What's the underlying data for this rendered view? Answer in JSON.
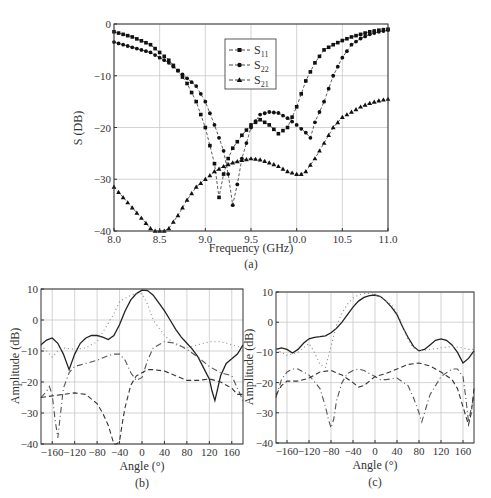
{
  "chart_data": [
    {
      "id": "a",
      "type": "line",
      "panel_label": "(a)",
      "title": "",
      "xlabel": "Frequency (GHz)",
      "ylabel": "S (DB)",
      "xlim": [
        8.0,
        11.0
      ],
      "ylim": [
        -40,
        0
      ],
      "xticks": [
        8.0,
        8.5,
        9.0,
        9.5,
        10.0,
        10.5,
        11.0
      ],
      "xtick_labels": [
        "8.0",
        "8.5",
        "9.0",
        "9.5",
        "10.0",
        "10.5",
        "11.0"
      ],
      "yticks": [
        0,
        -10,
        -20,
        -30,
        -40
      ],
      "ytick_labels": [
        "0",
        "−10",
        "−20",
        "−30",
        "−40"
      ],
      "grid": true,
      "legend_position": "upper center",
      "series": [
        {
          "name": "S11",
          "legend_main": "S",
          "legend_sub": "11",
          "marker": "square",
          "x": [
            8.0,
            8.2,
            8.4,
            8.5,
            8.6,
            8.7,
            8.8,
            8.9,
            9.0,
            9.1,
            9.15,
            9.2,
            9.25,
            9.3,
            9.4,
            9.5,
            9.6,
            9.7,
            9.8,
            9.9,
            10.0,
            10.1,
            10.2,
            10.3,
            10.4,
            10.5,
            10.6,
            10.7,
            10.8,
            10.9,
            11.0
          ],
          "y": [
            -1.5,
            -2.5,
            -4,
            -5.5,
            -7,
            -9,
            -11.5,
            -15,
            -20,
            -27,
            -33.5,
            -29,
            -26,
            -24,
            -21.5,
            -19.5,
            -18.5,
            -19.5,
            -21.2,
            -20,
            -16,
            -11,
            -7.5,
            -5,
            -4,
            -3.2,
            -2.5,
            -2,
            -1.5,
            -1.2,
            -1
          ]
        },
        {
          "name": "S22",
          "legend_main": "S",
          "legend_sub": "22",
          "marker": "circle",
          "x": [
            8.0,
            8.2,
            8.4,
            8.5,
            8.6,
            8.7,
            8.8,
            8.9,
            9.0,
            9.1,
            9.2,
            9.25,
            9.3,
            9.35,
            9.4,
            9.5,
            9.6,
            9.7,
            9.8,
            9.9,
            10.0,
            10.1,
            10.15,
            10.2,
            10.3,
            10.4,
            10.5,
            10.6,
            10.7,
            10.8,
            10.9,
            11.0
          ],
          "y": [
            -3.5,
            -4.5,
            -5.5,
            -6.5,
            -7.5,
            -9,
            -10.5,
            -12,
            -15,
            -19.5,
            -24.5,
            -29,
            -35,
            -31,
            -26,
            -20,
            -17.5,
            -17,
            -17.2,
            -18.2,
            -19.5,
            -21,
            -22,
            -19,
            -15,
            -10,
            -6.5,
            -4,
            -2.8,
            -2,
            -1.5,
            -1.2
          ]
        },
        {
          "name": "S21",
          "legend_main": "S",
          "legend_sub": "21",
          "marker": "triangle",
          "x": [
            8.0,
            8.1,
            8.2,
            8.3,
            8.4,
            8.45,
            8.5,
            8.55,
            8.6,
            8.7,
            8.8,
            8.9,
            9.0,
            9.1,
            9.2,
            9.3,
            9.4,
            9.5,
            9.6,
            9.7,
            9.8,
            9.9,
            10.0,
            10.05,
            10.1,
            10.2,
            10.3,
            10.4,
            10.5,
            10.6,
            10.7,
            10.8,
            10.9,
            11.0
          ],
          "y": [
            -31.5,
            -33.5,
            -35.5,
            -37.5,
            -39.5,
            -40,
            -40.2,
            -40,
            -39.5,
            -37,
            -34,
            -31.5,
            -30,
            -28.5,
            -27.5,
            -26.8,
            -26.3,
            -26,
            -26.2,
            -26.8,
            -27.5,
            -28.5,
            -29,
            -29,
            -28.5,
            -26,
            -23,
            -20,
            -18,
            -17,
            -16,
            -15.3,
            -14.8,
            -14.5
          ]
        }
      ]
    },
    {
      "id": "b",
      "type": "line",
      "panel_label": "(b)",
      "title": "",
      "xlabel": "Angle (°)",
      "ylabel": "Amplitude (dB)",
      "xlim": [
        -180,
        180
      ],
      "ylim": [
        -40,
        10
      ],
      "xticks": [
        -160,
        -120,
        -80,
        -40,
        0,
        40,
        80,
        120,
        160
      ],
      "xtick_labels": [
        "−160",
        "−120",
        "−80",
        "−40",
        "0",
        "40",
        "80",
        "120",
        "160"
      ],
      "yticks": [
        10,
        0,
        -10,
        -20,
        -30,
        -40
      ],
      "ytick_labels": [
        "10",
        "0",
        "−10",
        "−20",
        "−30",
        "−40"
      ],
      "grid": true,
      "series": [
        {
          "name": "solid",
          "style": "solid",
          "x": [
            -180,
            -170,
            -160,
            -150,
            -140,
            -130,
            -120,
            -110,
            -100,
            -90,
            -80,
            -70,
            -60,
            -50,
            -40,
            -30,
            -20,
            -10,
            0,
            10,
            20,
            30,
            40,
            50,
            60,
            70,
            80,
            90,
            100,
            110,
            120,
            125,
            130,
            135,
            140,
            150,
            160,
            170,
            180
          ],
          "y": [
            -8,
            -6.5,
            -5.8,
            -7.5,
            -11,
            -16,
            -11,
            -7.5,
            -5.8,
            -5,
            -5,
            -5.5,
            -6.3,
            -5,
            -1.5,
            3,
            6.5,
            8.5,
            9.6,
            9.5,
            8,
            5.5,
            3,
            0,
            -3,
            -5.5,
            -7.5,
            -9.5,
            -12,
            -15.5,
            -19,
            -23,
            -26,
            -22,
            -18,
            -14,
            -12.5,
            -11,
            -8
          ]
        },
        {
          "name": "dotted",
          "style": "dotted",
          "x": [
            -180,
            -170,
            -160,
            -150,
            -140,
            -120,
            -100,
            -80,
            -70,
            -60,
            -50,
            -40,
            -30,
            -20,
            -10,
            0,
            10,
            20,
            40,
            60,
            80,
            100,
            120,
            140,
            160,
            170,
            180
          ],
          "y": [
            -8,
            -10,
            -12,
            -10,
            -9,
            -9.5,
            -9,
            -7,
            -4,
            -1,
            2,
            6,
            7,
            8,
            8.5,
            8.5,
            5,
            0,
            -5,
            -8,
            -9,
            -8,
            -7,
            -7,
            -8,
            -8.5,
            -9
          ]
        },
        {
          "name": "dash-dot",
          "style": "dashdot",
          "x": [
            -180,
            -170,
            -165,
            -160,
            -155,
            -150,
            -145,
            -140,
            -130,
            -120,
            -100,
            -80,
            -60,
            -50,
            -40,
            -30,
            -20,
            -10,
            0,
            10,
            20,
            40,
            60,
            80,
            100,
            120,
            140,
            160,
            170,
            180
          ],
          "y": [
            -25,
            -23,
            -21.5,
            -24,
            -32,
            -38,
            -30,
            -22,
            -17,
            -15,
            -14,
            -13,
            -11.5,
            -11,
            -11,
            -13,
            -17,
            -19.5,
            -18.5,
            -13,
            -9,
            -7,
            -7.5,
            -9.5,
            -12,
            -15,
            -17,
            -18,
            -22,
            -26
          ]
        },
        {
          "name": "dashed",
          "style": "dashed",
          "x": [
            -180,
            -160,
            -140,
            -120,
            -100,
            -80,
            -70,
            -60,
            -55,
            -50,
            -45,
            -40,
            -35,
            -30,
            -20,
            -10,
            0,
            10,
            20,
            40,
            60,
            80,
            100,
            120,
            130,
            140,
            160,
            170,
            180
          ],
          "y": [
            -25,
            -24.5,
            -24,
            -23.5,
            -24,
            -27,
            -30,
            -34,
            -37,
            -40,
            -40,
            -39,
            -33,
            -28,
            -21,
            -18,
            -17,
            -16,
            -16,
            -16.5,
            -18,
            -19.5,
            -19.5,
            -19,
            -19.5,
            -20,
            -22,
            -24,
            -24
          ]
        }
      ]
    },
    {
      "id": "c",
      "type": "line",
      "panel_label": "(c)",
      "title": "",
      "xlabel": "Angle (°)",
      "ylabel": "Amplitude (dB)",
      "xlim": [
        -180,
        180
      ],
      "ylim": [
        -40,
        10
      ],
      "xticks": [
        -160,
        -120,
        -80,
        -40,
        0,
        40,
        80,
        120,
        160
      ],
      "xtick_labels": [
        "−160",
        "−120",
        "−80",
        "−40",
        "0",
        "40",
        "80",
        "120",
        "160"
      ],
      "yticks": [
        10,
        0,
        -10,
        -20,
        -30,
        -40
      ],
      "ytick_labels": [
        "10",
        "0",
        "−10",
        "−20",
        "−30",
        "−40"
      ],
      "grid": true,
      "series": [
        {
          "name": "solid",
          "style": "solid",
          "x": [
            -180,
            -170,
            -160,
            -150,
            -140,
            -130,
            -120,
            -110,
            -100,
            -90,
            -80,
            -70,
            -60,
            -50,
            -40,
            -30,
            -20,
            -10,
            0,
            10,
            20,
            30,
            40,
            50,
            60,
            70,
            80,
            90,
            100,
            110,
            120,
            130,
            140,
            150,
            160,
            170,
            180
          ],
          "y": [
            -9,
            -8.5,
            -9,
            -10.2,
            -9,
            -7,
            -5.5,
            -5,
            -4.8,
            -4.5,
            -3.5,
            -2,
            0,
            2.5,
            5,
            7,
            8.2,
            8.8,
            9,
            8.5,
            7,
            5,
            2.5,
            -1.5,
            -5,
            -8,
            -9.5,
            -9,
            -7.5,
            -6,
            -5.5,
            -6,
            -7.5,
            -10,
            -13.5,
            -12,
            -9.5
          ]
        },
        {
          "name": "dotted",
          "style": "dotted",
          "x": [
            -180,
            -170,
            -160,
            -140,
            -120,
            -110,
            -100,
            -90,
            -80,
            -70,
            -60,
            -50,
            -40,
            -30,
            -20,
            -10,
            0,
            10,
            20,
            30,
            40,
            50,
            60,
            70,
            80,
            100,
            120,
            140,
            160,
            170,
            180
          ],
          "y": [
            -9,
            -10,
            -11,
            -10,
            -7,
            -10,
            -14,
            -15,
            -8,
            -1,
            3,
            6,
            8,
            9,
            9.5,
            9.5,
            9,
            8.5,
            7,
            6,
            3,
            -1,
            -6,
            -8.5,
            -9.5,
            -9,
            -8.5,
            -8,
            -8.5,
            -9,
            -9
          ]
        },
        {
          "name": "dash-dot",
          "style": "dashdot",
          "x": [
            -180,
            -170,
            -160,
            -150,
            -140,
            -120,
            -100,
            -90,
            -85,
            -80,
            -75,
            -70,
            -60,
            -50,
            -40,
            -30,
            -20,
            -10,
            0,
            10,
            20,
            40,
            60,
            70,
            80,
            85,
            90,
            100,
            120,
            140,
            150,
            160,
            165,
            170,
            180
          ],
          "y": [
            -25,
            -19,
            -16.5,
            -15.5,
            -15.5,
            -17.5,
            -22,
            -28,
            -32,
            -35,
            -32,
            -26,
            -20,
            -17,
            -16,
            -15.5,
            -16,
            -17,
            -18,
            -19,
            -19,
            -18.5,
            -21,
            -25,
            -30,
            -33,
            -30,
            -24,
            -18,
            -15.5,
            -15.5,
            -18,
            -25,
            -33,
            -24
          ]
        },
        {
          "name": "dashed",
          "style": "dashed",
          "x": [
            -180,
            -170,
            -160,
            -140,
            -120,
            -100,
            -80,
            -60,
            -40,
            -30,
            -20,
            -10,
            0,
            20,
            40,
            60,
            80,
            100,
            120,
            140,
            150,
            160,
            170,
            175,
            180
          ],
          "y": [
            -24,
            -21,
            -19.5,
            -19.5,
            -18.5,
            -16.5,
            -16,
            -17.5,
            -20,
            -21.5,
            -21,
            -19.5,
            -18,
            -17,
            -15.5,
            -14,
            -13.5,
            -14.5,
            -16.5,
            -19,
            -22,
            -28,
            -34,
            -30,
            -22
          ]
        }
      ]
    }
  ]
}
